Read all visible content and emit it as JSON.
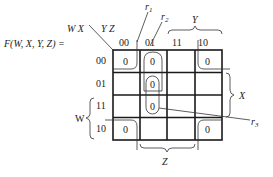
{
  "function_label": "F(W, X, Y, Z) =",
  "row_var_label": "W X",
  "col_var_label": "Y Z",
  "column_headers": [
    "00",
    "01",
    "11",
    "10"
  ],
  "row_headers": [
    "00",
    "01",
    "11",
    "10"
  ],
  "cells": [
    [
      "0",
      "0",
      "",
      "0"
    ],
    [
      "",
      "0",
      "",
      ""
    ],
    [
      "",
      "0",
      "",
      ""
    ],
    [
      "0",
      "",
      "",
      "0"
    ]
  ],
  "group_labels": {
    "r1": "r",
    "r1_sub": "1",
    "r2": "r",
    "r2_sub": "2",
    "r3": "r",
    "r3_sub": "3"
  },
  "brace_labels": {
    "Y": "Y",
    "X": "X",
    "W": "W",
    "Z": "Z"
  }
}
